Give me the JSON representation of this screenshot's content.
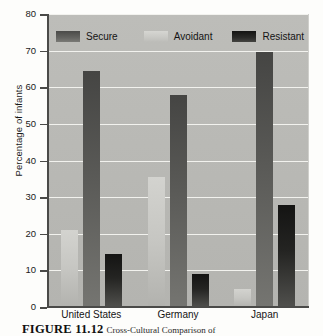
{
  "chart_data": {
    "type": "bar",
    "title": "",
    "xlabel": "",
    "ylabel": "Percentage of infants",
    "ylim": [
      0,
      80
    ],
    "yticks": [
      0,
      10,
      20,
      30,
      40,
      50,
      60,
      70,
      80
    ],
    "grid": true,
    "legend_position": "top-inside",
    "categories": [
      "United States",
      "Germany",
      "Japan"
    ],
    "bar_order": [
      "Avoidant",
      "Secure",
      "Resistant"
    ],
    "series": [
      {
        "name": "Secure",
        "color": "#5a5a57",
        "values": [
          64.5,
          58,
          69.5
        ]
      },
      {
        "name": "Avoidant",
        "color": "#c6c6c2",
        "values": [
          21,
          35.5,
          5
        ]
      },
      {
        "name": "Resistant",
        "color": "#242422",
        "values": [
          14.5,
          9,
          27.8
        ]
      }
    ]
  },
  "legend": {
    "items": [
      {
        "label": "Secure",
        "swatch": "secure"
      },
      {
        "label": "Avoidant",
        "swatch": "avoidant"
      },
      {
        "label": "Resistant",
        "swatch": "resistant"
      }
    ]
  },
  "caption": {
    "figure_number": "FIGURE 11.12",
    "text": "Cross-Cultural Comparison of"
  }
}
